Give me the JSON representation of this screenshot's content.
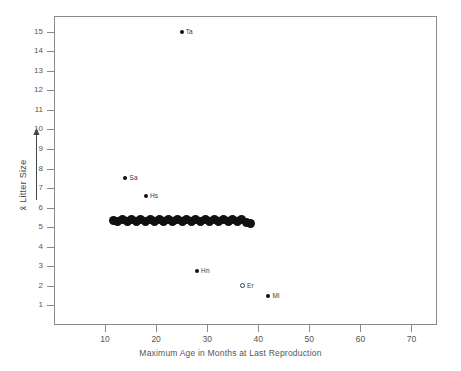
{
  "chart_data": {
    "type": "scatter",
    "title": "",
    "xlabel": "Maximum Age in Months at Last Reproduction",
    "ylabel": "x̄ Litter Size",
    "xlim": [
      0,
      75
    ],
    "ylim": [
      0,
      15.8
    ],
    "xticks": [
      10,
      20,
      30,
      40,
      50,
      60,
      70
    ],
    "yticks": [
      1,
      2,
      3,
      4,
      5,
      6,
      7,
      8,
      9,
      10,
      11,
      12,
      13,
      14,
      15
    ],
    "grid": false,
    "legend": null,
    "series": [
      {
        "name": "labeled species",
        "marker": "filled-circle",
        "points": [
          {
            "label": "Ta",
            "x": 25.0,
            "y": 15.0
          },
          {
            "label": "Sa",
            "x": 14.0,
            "y": 7.5
          },
          {
            "label": "Hs",
            "x": 18.0,
            "y": 6.6
          },
          {
            "label": "Hn",
            "x": 28.0,
            "y": 2.75
          },
          {
            "label": "Ml",
            "x": 42.0,
            "y": 1.5
          }
        ]
      },
      {
        "name": "open marker species",
        "marker": "open-circle",
        "points": [
          {
            "label": "Er",
            "x": 37.0,
            "y": 2.0
          }
        ]
      },
      {
        "name": "dense cluster band",
        "marker": "filled-circle-cluster",
        "points": [
          {
            "label": "",
            "x": 11.6,
            "y": 5.35
          },
          {
            "label": "",
            "x": 12.5,
            "y": 5.28
          },
          {
            "label": "",
            "x": 13.4,
            "y": 5.4
          },
          {
            "label": "",
            "x": 14.3,
            "y": 5.27
          },
          {
            "label": "",
            "x": 15.2,
            "y": 5.4
          },
          {
            "label": "",
            "x": 16.1,
            "y": 5.27
          },
          {
            "label": "",
            "x": 17.0,
            "y": 5.4
          },
          {
            "label": "",
            "x": 17.9,
            "y": 5.27
          },
          {
            "label": "",
            "x": 18.8,
            "y": 5.4
          },
          {
            "label": "",
            "x": 19.7,
            "y": 5.27
          },
          {
            "label": "",
            "x": 20.6,
            "y": 5.4
          },
          {
            "label": "",
            "x": 21.5,
            "y": 5.27
          },
          {
            "label": "",
            "x": 22.4,
            "y": 5.4
          },
          {
            "label": "",
            "x": 23.3,
            "y": 5.27
          },
          {
            "label": "",
            "x": 24.2,
            "y": 5.4
          },
          {
            "label": "",
            "x": 25.1,
            "y": 5.27
          },
          {
            "label": "",
            "x": 26.0,
            "y": 5.4
          },
          {
            "label": "",
            "x": 26.9,
            "y": 5.27
          },
          {
            "label": "",
            "x": 27.8,
            "y": 5.4
          },
          {
            "label": "",
            "x": 28.7,
            "y": 5.27
          },
          {
            "label": "",
            "x": 29.6,
            "y": 5.4
          },
          {
            "label": "",
            "x": 30.5,
            "y": 5.27
          },
          {
            "label": "",
            "x": 31.4,
            "y": 5.4
          },
          {
            "label": "",
            "x": 32.3,
            "y": 5.27
          },
          {
            "label": "",
            "x": 33.2,
            "y": 5.4
          },
          {
            "label": "",
            "x": 34.1,
            "y": 5.27
          },
          {
            "label": "",
            "x": 35.0,
            "y": 5.4
          },
          {
            "label": "",
            "x": 35.9,
            "y": 5.27
          },
          {
            "label": "",
            "x": 36.8,
            "y": 5.4
          },
          {
            "label": "",
            "x": 37.7,
            "y": 5.22
          },
          {
            "label": "",
            "x": 38.4,
            "y": 5.2
          }
        ]
      }
    ]
  }
}
